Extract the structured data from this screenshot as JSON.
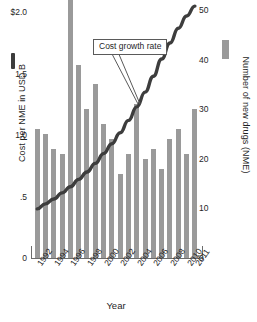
{
  "chart_data": {
    "type": "bar",
    "title": "",
    "subtitle": "",
    "xlabel": "Year",
    "ylabel": "Cost per NME in USD B",
    "y2label": "Number of new drugs (NME)",
    "grid": false,
    "legend_position": "inline-axis-swatches",
    "x": [
      1992,
      1993,
      1994,
      1995,
      1996,
      1997,
      1998,
      1999,
      2000,
      2001,
      2002,
      2003,
      2004,
      2005,
      2006,
      2007,
      2008,
      2009,
      2010,
      2011
    ],
    "categories": [
      "1992",
      "1993",
      "1994",
      "1995",
      "1996",
      "1997",
      "1998",
      "1999",
      "2000",
      "2001",
      "2002",
      "2003",
      "2004",
      "2005",
      "2006",
      "2007",
      "2008",
      "2009",
      "2010",
      "2011"
    ],
    "xtick_labels": [
      "1992",
      "1994",
      "1996",
      "1998",
      "2000",
      "2002",
      "2004",
      "2006",
      "2008",
      "2010",
      "2011"
    ],
    "xtick_years": [
      1992,
      1994,
      1996,
      1998,
      2000,
      2002,
      2004,
      2006,
      2008,
      2010,
      2011
    ],
    "ylim": [
      0,
      2.1
    ],
    "ytick_labels": [
      "$2.0",
      "1.5",
      "1.0",
      ".5",
      "0"
    ],
    "ytick_values": [
      2.0,
      1.5,
      1.0,
      0.5,
      0
    ],
    "y2lim": [
      0,
      52
    ],
    "y2tick_labels": [
      "50",
      "40",
      "30",
      "20",
      "10",
      "0"
    ],
    "y2tick_values": [
      50,
      40,
      30,
      20,
      10,
      0
    ],
    "series": [
      {
        "name": "Number of new drugs (NME)",
        "type": "bar",
        "axis": "right",
        "color": "#9a9a9a",
        "values": [
          26,
          25,
          22,
          21,
          53,
          39,
          30,
          35,
          27,
          24,
          17,
          21,
          31,
          20,
          22,
          18,
          24,
          26,
          21,
          30
        ]
      },
      {
        "name": "Cost growth rate",
        "type": "line",
        "axis": "left",
        "color": "#3d3d3d",
        "values": [
          0.4,
          0.44,
          0.48,
          0.53,
          0.58,
          0.64,
          0.7,
          0.77,
          0.85,
          0.93,
          1.02,
          1.12,
          1.23,
          1.35,
          1.48,
          1.62,
          1.75,
          1.87,
          1.97,
          2.05
        ]
      }
    ],
    "annotations": [
      {
        "text": "Cost growth rate",
        "target": "cost-growth-curve"
      }
    ]
  },
  "axes": {
    "left_title": "Cost per NME in USD B",
    "right_title": "Number of new drugs (NME)",
    "x_title": "Year"
  },
  "annotation": {
    "label": "Cost growth rate"
  }
}
